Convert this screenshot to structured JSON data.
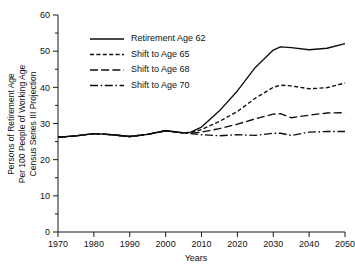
{
  "chart_data": {
    "type": "line",
    "title": "",
    "xlabel": "Years",
    "ylabel": "Persons of Retirement Age Per 100 People of Working Age Census Series III Projection",
    "ylabel_lines": [
      "Persons of Retirement Age",
      "Per 100 People of Working Age",
      "Census Series III Projection"
    ],
    "xlim": [
      1970,
      2050
    ],
    "ylim": [
      0,
      60
    ],
    "xticks": [
      1970,
      1980,
      1990,
      2000,
      2010,
      2020,
      2030,
      2040,
      2050
    ],
    "yticks": [
      0,
      10,
      20,
      30,
      40,
      50,
      60
    ],
    "yticks_minor": [
      5,
      15,
      25,
      35,
      45,
      55
    ],
    "grid": false,
    "legend_position": "upper-left-inside",
    "x": [
      1970,
      1975,
      1980,
      1985,
      1990,
      1995,
      2000,
      2005,
      2007,
      2010,
      2015,
      2020,
      2025,
      2030,
      2032,
      2035,
      2040,
      2045,
      2050
    ],
    "series": [
      {
        "name": "Retirement Age 62",
        "style": "solid",
        "values": [
          26.2,
          26.6,
          27.2,
          26.9,
          26.4,
          27.0,
          28.0,
          27.4,
          27.6,
          29.0,
          33.5,
          39.0,
          45.5,
          50.3,
          51.2,
          51.0,
          50.4,
          50.8,
          52.1
        ]
      },
      {
        "name": "Shift to Age 65",
        "style": "short-dash",
        "values": [
          26.2,
          26.6,
          27.2,
          26.9,
          26.4,
          27.0,
          28.0,
          27.4,
          27.5,
          28.3,
          30.6,
          33.3,
          37.0,
          40.0,
          40.6,
          40.4,
          39.6,
          39.9,
          41.2
        ]
      },
      {
        "name": "Shift to Age 68",
        "style": "long-dash",
        "values": [
          26.2,
          26.6,
          27.2,
          26.9,
          26.4,
          27.0,
          28.0,
          27.4,
          27.3,
          27.6,
          28.6,
          29.8,
          31.3,
          32.6,
          32.7,
          31.6,
          32.3,
          32.9,
          33.0
        ]
      },
      {
        "name": "Shift to Age 70",
        "style": "dash-dot",
        "values": [
          26.2,
          26.6,
          27.2,
          26.9,
          26.4,
          27.0,
          28.0,
          27.4,
          27.2,
          26.9,
          26.6,
          26.9,
          26.7,
          27.3,
          27.3,
          26.7,
          27.6,
          27.8,
          27.8
        ]
      }
    ]
  },
  "legend": {
    "items": [
      {
        "label": "Retirement Age 62",
        "style": "solid"
      },
      {
        "label": "Shift to Age 65",
        "style": "short-dash"
      },
      {
        "label": "Shift to Age 68",
        "style": "long-dash"
      },
      {
        "label": "Shift to Age 70",
        "style": "dash-dot"
      }
    ]
  },
  "colors": {
    "line": "#0d0d0d",
    "axis": "#1a1a1a",
    "text": "#111111",
    "background": "#ffffff"
  }
}
